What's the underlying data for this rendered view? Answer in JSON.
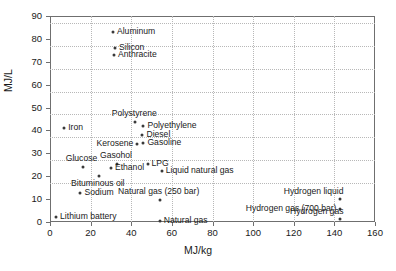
{
  "chart_data": {
    "type": "scatter",
    "title": "",
    "xlabel": "MJ/kg",
    "ylabel": "MJ/L",
    "xlim": [
      0,
      160
    ],
    "ylim": [
      0,
      90
    ],
    "xticks": [
      0,
      20,
      40,
      60,
      80,
      100,
      120,
      140,
      160
    ],
    "yticks": [
      0,
      10,
      20,
      30,
      40,
      50,
      60,
      70,
      80,
      90
    ],
    "grid": true,
    "legend": "none",
    "marker_color": "#3a3a3a",
    "axis_color": "#6f6f6f",
    "grid_color": "#b8b8b8",
    "points": [
      {
        "label": "Aluminum",
        "x": 31,
        "y": 83,
        "pos": "right"
      },
      {
        "label": "Silicon",
        "x": 32,
        "y": 76,
        "pos": "right"
      },
      {
        "label": "Anthracite",
        "x": 31.5,
        "y": 73,
        "pos": "right"
      },
      {
        "label": "Iron",
        "x": 7,
        "y": 41,
        "pos": "right"
      },
      {
        "label": "Polystyrene",
        "x": 42,
        "y": 43.5,
        "pos": "above"
      },
      {
        "label": "Polyethylene",
        "x": 46,
        "y": 42,
        "pos": "right"
      },
      {
        "label": "Diesel",
        "x": 45.5,
        "y": 38,
        "pos": "right"
      },
      {
        "label": "Gasoline",
        "x": 46,
        "y": 34.5,
        "pos": "right"
      },
      {
        "label": "Kerosene",
        "x": 43,
        "y": 34,
        "pos": "left"
      },
      {
        "label": "Glucose",
        "x": 16,
        "y": 24,
        "pos": "above"
      },
      {
        "label": "Gasohol",
        "x": 33,
        "y": 25.5,
        "pos": "above"
      },
      {
        "label": "LPG",
        "x": 48,
        "y": 25.5,
        "pos": "right"
      },
      {
        "label": "Ethanol",
        "x": 30,
        "y": 23.5,
        "pos": "right"
      },
      {
        "label": "Liquid natural gas",
        "x": 55,
        "y": 22.5,
        "pos": "right"
      },
      {
        "label": "Bituminous oil",
        "x": 24,
        "y": 20,
        "pos": "below"
      },
      {
        "label": "Sodium",
        "x": 15,
        "y": 12.5,
        "pos": "right"
      },
      {
        "label": "Natural gas (250 bar)",
        "x": 54,
        "y": 9.5,
        "pos": "above"
      },
      {
        "label": "Lithium battery",
        "x": 3,
        "y": 2,
        "pos": "right"
      },
      {
        "label": "Natural gas",
        "x": 54,
        "y": 0.5,
        "pos": "right"
      },
      {
        "label": "Hydrogen liquid",
        "x": 143,
        "y": 10,
        "pos": "above-left"
      },
      {
        "label": "Hydrogen gas (700 bar)",
        "x": 143,
        "y": 5.6,
        "pos": "left"
      },
      {
        "label": "Hydrogen gas",
        "x": 143,
        "y": 1.5,
        "pos": "above-left"
      }
    ]
  }
}
